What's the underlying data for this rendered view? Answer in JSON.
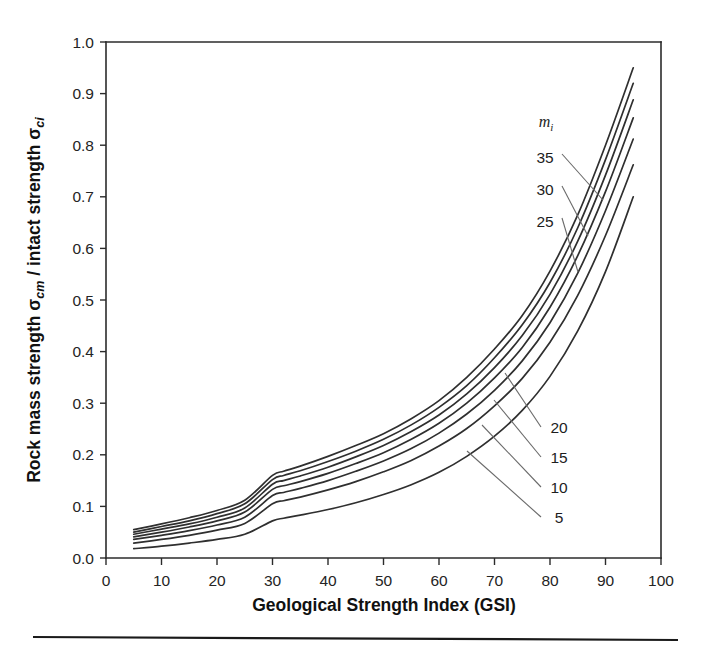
{
  "figure": {
    "background_color": "#ffffff",
    "ink_color": "#2f2f2f",
    "bottom_rule_visible": "yes"
  },
  "axes": {
    "x_title": "Geological Strength Index (GSI)",
    "y_title_parts": {
      "lead": "Rock mass strength ",
      "sigma_cm": "σ",
      "sub_cm": "cm",
      "middle": " / intact strength ",
      "sigma_ci": "σ",
      "sub_ci": "ci"
    },
    "x_ticks": [
      "0",
      "10",
      "20",
      "30",
      "40",
      "50",
      "60",
      "70",
      "80",
      "90",
      "100"
    ],
    "y_ticks": [
      "0.0",
      "0.1",
      "0.2",
      "0.3",
      "0.4",
      "0.5",
      "0.6",
      "0.7",
      "0.8",
      "0.9",
      "1.0"
    ]
  },
  "legend": {
    "title_letter": "m",
    "title_sub": "i",
    "upper_labels": [
      "35",
      "30",
      "25"
    ],
    "lower_labels": [
      "20",
      "15",
      "10",
      "5"
    ]
  },
  "chart_data": {
    "type": "line",
    "title": "",
    "xlabel": "Geological Strength Index (GSI)",
    "ylabel": "Rock mass strength σcm / intact strength σci",
    "xlim": [
      0,
      100
    ],
    "ylim": [
      0,
      1.0
    ],
    "xticks": [
      0,
      10,
      20,
      30,
      40,
      50,
      60,
      70,
      80,
      90,
      100
    ],
    "yticks": [
      0.0,
      0.1,
      0.2,
      0.3,
      0.4,
      0.5,
      0.6,
      0.7,
      0.8,
      0.9,
      1.0
    ],
    "grid": false,
    "legend_position": "inside-right",
    "legend_title": "mi",
    "x": [
      5,
      10,
      15,
      20,
      25,
      30,
      32,
      35,
      40,
      45,
      50,
      55,
      60,
      65,
      70,
      75,
      80,
      85,
      90,
      95
    ],
    "series": [
      {
        "name": "35",
        "values": [
          0.055,
          0.066,
          0.078,
          0.092,
          0.112,
          0.16,
          0.168,
          0.178,
          0.197,
          0.218,
          0.241,
          0.27,
          0.305,
          0.35,
          0.405,
          0.47,
          0.556,
          0.665,
          0.8,
          0.95
        ]
      },
      {
        "name": "30",
        "values": [
          0.05,
          0.061,
          0.072,
          0.086,
          0.105,
          0.152,
          0.16,
          0.169,
          0.187,
          0.207,
          0.23,
          0.258,
          0.292,
          0.334,
          0.388,
          0.452,
          0.534,
          0.64,
          0.772,
          0.92
        ]
      },
      {
        "name": "25",
        "values": [
          0.046,
          0.056,
          0.066,
          0.079,
          0.097,
          0.143,
          0.15,
          0.159,
          0.176,
          0.196,
          0.218,
          0.245,
          0.277,
          0.318,
          0.369,
          0.431,
          0.511,
          0.614,
          0.742,
          0.888
        ]
      },
      {
        "name": "20",
        "values": [
          0.041,
          0.05,
          0.06,
          0.072,
          0.089,
          0.133,
          0.14,
          0.148,
          0.164,
          0.183,
          0.204,
          0.23,
          0.261,
          0.3,
          0.349,
          0.408,
          0.486,
          0.586,
          0.71,
          0.853
        ]
      },
      {
        "name": "15",
        "values": [
          0.036,
          0.044,
          0.053,
          0.064,
          0.079,
          0.121,
          0.127,
          0.135,
          0.15,
          0.168,
          0.188,
          0.212,
          0.242,
          0.279,
          0.325,
          0.382,
          0.456,
          0.552,
          0.673,
          0.812
        ]
      },
      {
        "name": "10",
        "values": [
          0.029,
          0.036,
          0.044,
          0.054,
          0.067,
          0.105,
          0.111,
          0.118,
          0.132,
          0.148,
          0.167,
          0.189,
          0.217,
          0.251,
          0.295,
          0.348,
          0.418,
          0.509,
          0.625,
          0.762
        ]
      },
      {
        "name": "5",
        "values": [
          0.018,
          0.023,
          0.029,
          0.036,
          0.046,
          0.072,
          0.077,
          0.083,
          0.094,
          0.107,
          0.123,
          0.142,
          0.166,
          0.197,
          0.236,
          0.286,
          0.352,
          0.44,
          0.555,
          0.7
        ]
      }
    ]
  }
}
